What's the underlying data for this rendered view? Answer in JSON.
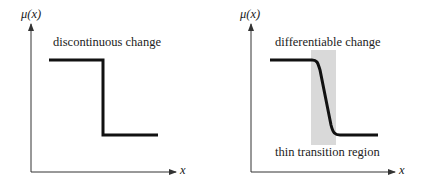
{
  "panels": [
    {
      "y_axis_label": "μ(x)",
      "x_axis_label": "x",
      "title": "discontinuous change"
    },
    {
      "y_axis_label": "μ(x)",
      "x_axis_label": "x",
      "title": "differentiable change",
      "region_label": "thin transition region"
    }
  ],
  "colors": {
    "curve": "#111111",
    "axis": "#333333",
    "transition_region": "#d9d9d9"
  }
}
